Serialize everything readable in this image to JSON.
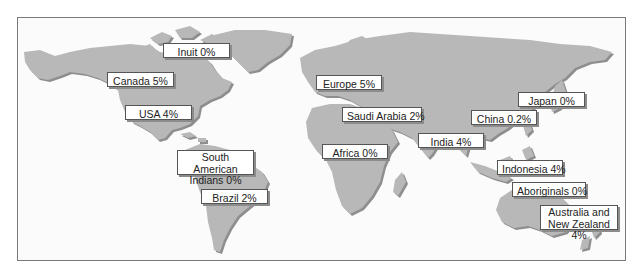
{
  "map": {
    "colors": {
      "land": "#b8b8b8",
      "land_shadow": "#8e8e8e",
      "frame": "#7a7a7a",
      "label_border": "#555555"
    },
    "labels": [
      {
        "id": "inuit",
        "text": "Inuit 0%",
        "x": 163,
        "y": 43,
        "w": 67,
        "h": 15
      },
      {
        "id": "canada",
        "text": "Canada 5%",
        "x": 107,
        "y": 72,
        "w": 67,
        "h": 15
      },
      {
        "id": "usa",
        "text": "USA 4%",
        "x": 125,
        "y": 105,
        "w": 67,
        "h": 15
      },
      {
        "id": "europe",
        "text": "Europe 5%",
        "x": 316,
        "y": 75,
        "w": 66,
        "h": 15
      },
      {
        "id": "saudi-arabia",
        "text": "Saudi Arabia 2%",
        "x": 342,
        "y": 107,
        "w": 80,
        "h": 15
      },
      {
        "id": "japan",
        "text": "Japan 0%",
        "x": 518,
        "y": 92,
        "w": 67,
        "h": 15
      },
      {
        "id": "china",
        "text": "China 0.2%",
        "x": 471,
        "y": 110,
        "w": 66,
        "h": 15
      },
      {
        "id": "india",
        "text": "India 4%",
        "x": 418,
        "y": 133,
        "w": 66,
        "h": 15
      },
      {
        "id": "africa",
        "text": "Africa 0%",
        "x": 322,
        "y": 144,
        "w": 66,
        "h": 15
      },
      {
        "id": "south-american-indians",
        "text": "South American Indians 0%",
        "x": 177,
        "y": 150,
        "w": 77,
        "h": 25,
        "multiline": true
      },
      {
        "id": "brazil",
        "text": "Brazil 2%",
        "x": 201,
        "y": 189,
        "w": 67,
        "h": 15
      },
      {
        "id": "indonesia",
        "text": "Indonesia 4%",
        "x": 497,
        "y": 160,
        "w": 66,
        "h": 15
      },
      {
        "id": "aboriginals",
        "text": "Aboriginals 0%",
        "x": 512,
        "y": 182,
        "w": 74,
        "h": 15
      },
      {
        "id": "australia-nz",
        "text": "Australia and New Zealand 4%",
        "x": 540,
        "y": 205,
        "w": 78,
        "h": 25,
        "multiline": true
      }
    ]
  }
}
